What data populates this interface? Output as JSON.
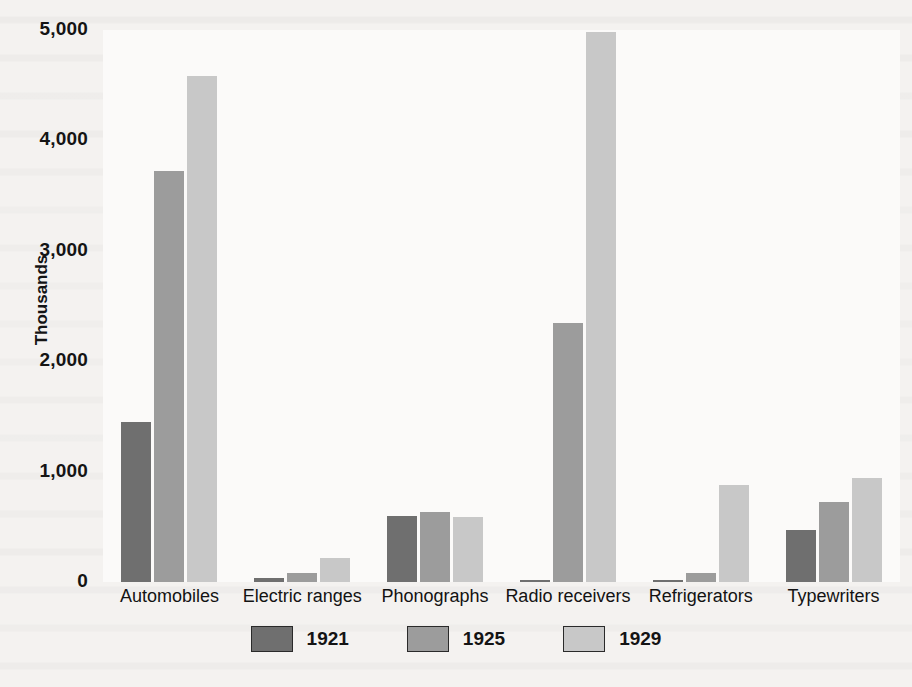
{
  "chart_data": {
    "type": "bar",
    "title": "",
    "xlabel": "",
    "ylabel": "Thousands",
    "ylim": [
      0,
      5000
    ],
    "yticks": [
      0,
      1000,
      2000,
      3000,
      4000,
      5000
    ],
    "ytick_labels": [
      "0",
      "1,000",
      "2,000",
      "3,000",
      "4,000",
      "5,000"
    ],
    "grid": false,
    "legend_position": "bottom",
    "categories": [
      "Automobiles",
      "Electric ranges",
      "Phonographs",
      "Radio receivers",
      "Refrigerators",
      "Typewriters"
    ],
    "series": [
      {
        "name": "1921",
        "color": "#6f6f6f",
        "values": [
          1450,
          35,
          600,
          10,
          10,
          475
        ]
      },
      {
        "name": "1925",
        "color": "#9c9c9c",
        "values": [
          3720,
          80,
          630,
          2350,
          85,
          725
        ]
      },
      {
        "name": "1929",
        "color": "#c8c8c8",
        "values": [
          4580,
          215,
          590,
          4980,
          880,
          940
        ]
      }
    ]
  },
  "colors": {
    "series_1921": "#6f6f6f",
    "series_1925": "#9c9c9c",
    "series_1929": "#c8c8c8",
    "plot_background": "#fbfaf9",
    "page_background": "#f4f2f0",
    "text": "#141414"
  }
}
